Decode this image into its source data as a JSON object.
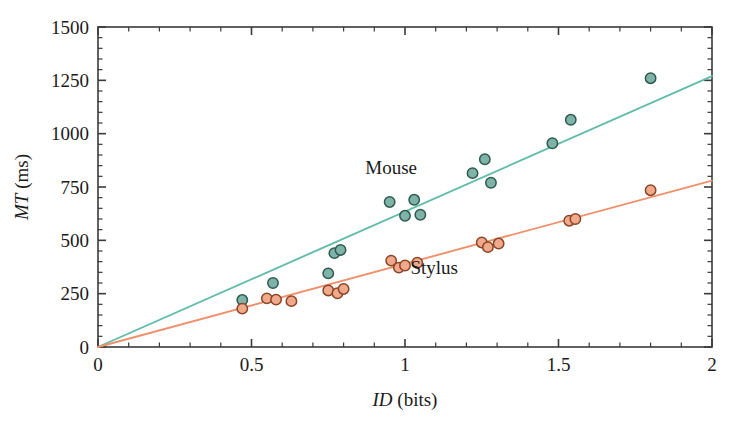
{
  "figure": {
    "background_color": "#ffffff",
    "frame_color": "#3a3a3a"
  },
  "axes": {
    "x": {
      "label_italic": "ID",
      "label_rest": " (bits)",
      "label_full": "ID (bits)",
      "min": 0,
      "max": 2,
      "major_ticks": [
        0,
        0.5,
        1,
        1.5,
        2
      ],
      "tick_labels": [
        "0",
        "0.5",
        "1",
        "1.5",
        "2"
      ],
      "minor_tick_step": 0.1
    },
    "y": {
      "label_italic": "MT",
      "label_rest": " (ms)",
      "label_full": "MT (ms)",
      "min": 0,
      "max": 1500,
      "major_ticks": [
        0,
        250,
        500,
        750,
        1000,
        1250,
        1500
      ],
      "tick_labels": [
        "0",
        "250",
        "500",
        "750",
        "1000",
        "1250",
        "1500"
      ],
      "minor_tick_step": 50
    }
  },
  "annotations": [
    {
      "name": "mouse-label",
      "text": "Mouse",
      "x": 0.955,
      "y": 810
    },
    {
      "name": "stylus-label",
      "text": "Stylus",
      "x": 1.095,
      "y": 340
    }
  ],
  "chart_data": {
    "type": "scatter",
    "title": "",
    "xlabel": "ID (bits)",
    "ylabel": "MT (ms)",
    "xlim": [
      0,
      2
    ],
    "ylim": [
      0,
      1500
    ],
    "grid": false,
    "legend": "inline-annotations",
    "series": [
      {
        "name": "Mouse",
        "marker_fill": "#7FB3A8",
        "marker_stroke": "#2d5a50",
        "line_color": "#62BCA9",
        "fit_line": {
          "intercept": 0,
          "slope": 635,
          "x_start": 0,
          "x_end": 2
        },
        "points": [
          {
            "x": 0.47,
            "y": 220
          },
          {
            "x": 0.57,
            "y": 300
          },
          {
            "x": 0.75,
            "y": 345
          },
          {
            "x": 0.77,
            "y": 440
          },
          {
            "x": 0.79,
            "y": 455
          },
          {
            "x": 0.95,
            "y": 680
          },
          {
            "x": 1.0,
            "y": 615
          },
          {
            "x": 1.03,
            "y": 690
          },
          {
            "x": 1.05,
            "y": 620
          },
          {
            "x": 1.22,
            "y": 815
          },
          {
            "x": 1.26,
            "y": 880
          },
          {
            "x": 1.28,
            "y": 770
          },
          {
            "x": 1.48,
            "y": 955
          },
          {
            "x": 1.54,
            "y": 1065
          },
          {
            "x": 1.8,
            "y": 1260
          }
        ]
      },
      {
        "name": "Stylus",
        "marker_fill": "#F0A98A",
        "marker_stroke": "#8a4526",
        "line_color": "#F0906A",
        "fit_line": {
          "intercept": 0,
          "slope": 390,
          "x_start": 0,
          "x_end": 2
        },
        "points": [
          {
            "x": 0.47,
            "y": 180
          },
          {
            "x": 0.55,
            "y": 228
          },
          {
            "x": 0.58,
            "y": 222
          },
          {
            "x": 0.63,
            "y": 215
          },
          {
            "x": 0.75,
            "y": 265
          },
          {
            "x": 0.78,
            "y": 252
          },
          {
            "x": 0.8,
            "y": 272
          },
          {
            "x": 0.955,
            "y": 405
          },
          {
            "x": 0.98,
            "y": 372
          },
          {
            "x": 1.0,
            "y": 382
          },
          {
            "x": 1.04,
            "y": 395
          },
          {
            "x": 1.25,
            "y": 490
          },
          {
            "x": 1.27,
            "y": 468
          },
          {
            "x": 1.305,
            "y": 485
          },
          {
            "x": 1.535,
            "y": 592
          },
          {
            "x": 1.555,
            "y": 600
          },
          {
            "x": 1.8,
            "y": 735
          }
        ]
      }
    ]
  }
}
